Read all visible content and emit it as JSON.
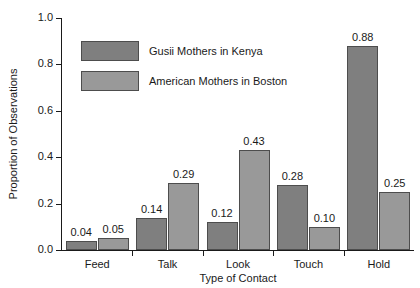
{
  "chart_data": {
    "type": "bar",
    "title": "",
    "xlabel": "Type of Contact",
    "ylabel": "Proportion of Observations",
    "categories": [
      "Feed",
      "Talk",
      "Look",
      "Touch",
      "Hold"
    ],
    "series": [
      {
        "name": "Gusii Mothers in Kenya",
        "color": "#7f7f7f",
        "values": [
          0.04,
          0.14,
          0.12,
          0.28,
          0.88
        ],
        "labels": [
          "0.04",
          "0.14",
          "0.12",
          "0.28",
          "0.88"
        ]
      },
      {
        "name": "American Mothers in Boston",
        "color": "#999999",
        "values": [
          0.05,
          0.29,
          0.43,
          0.1,
          0.25
        ],
        "labels": [
          "0.05",
          "0.29",
          "0.43",
          "0.10",
          "0.25"
        ]
      }
    ],
    "ylim": [
      0.0,
      1.0
    ],
    "yticks": [
      0.0,
      0.2,
      0.4,
      0.6,
      0.8,
      1.0
    ],
    "ytick_labels": [
      "0.0",
      "0.2",
      "0.4",
      "0.6",
      "0.8",
      "1.0"
    ],
    "grid": false,
    "legend_position": "upper-left-inside",
    "value_labels": true
  }
}
